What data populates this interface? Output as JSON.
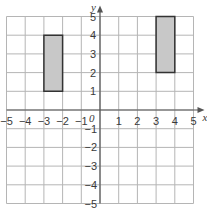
{
  "diagram": {
    "type": "coordinate-grid",
    "x_axis": {
      "label": "x",
      "min": -5,
      "max": 5,
      "ticks": [
        "−5",
        "−4",
        "−3",
        "−2",
        "−1",
        "1",
        "2",
        "3",
        "4",
        "5"
      ]
    },
    "y_axis": {
      "label": "y",
      "min": -5,
      "max": 5,
      "ticks_pos": [
        "1",
        "2",
        "3",
        "4",
        "5"
      ],
      "ticks_neg": [
        "−1",
        "−2",
        "−3",
        "−4",
        "−5"
      ]
    },
    "origin_label": "0",
    "shapes": [
      {
        "name": "rectangle-a",
        "vertices": [
          [
            -3,
            1
          ],
          [
            -2,
            1
          ],
          [
            -2,
            4
          ],
          [
            -3,
            4
          ]
        ],
        "fill": "#c8c8c8",
        "stroke": "#333333"
      },
      {
        "name": "rectangle-b",
        "vertices": [
          [
            3,
            2
          ],
          [
            4,
            2
          ],
          [
            4,
            5
          ],
          [
            3,
            5
          ]
        ],
        "fill": "#c8c8c8",
        "stroke": "#333333"
      }
    ],
    "colors": {
      "grid": "#b5b5b5",
      "axis": "#555555"
    }
  }
}
